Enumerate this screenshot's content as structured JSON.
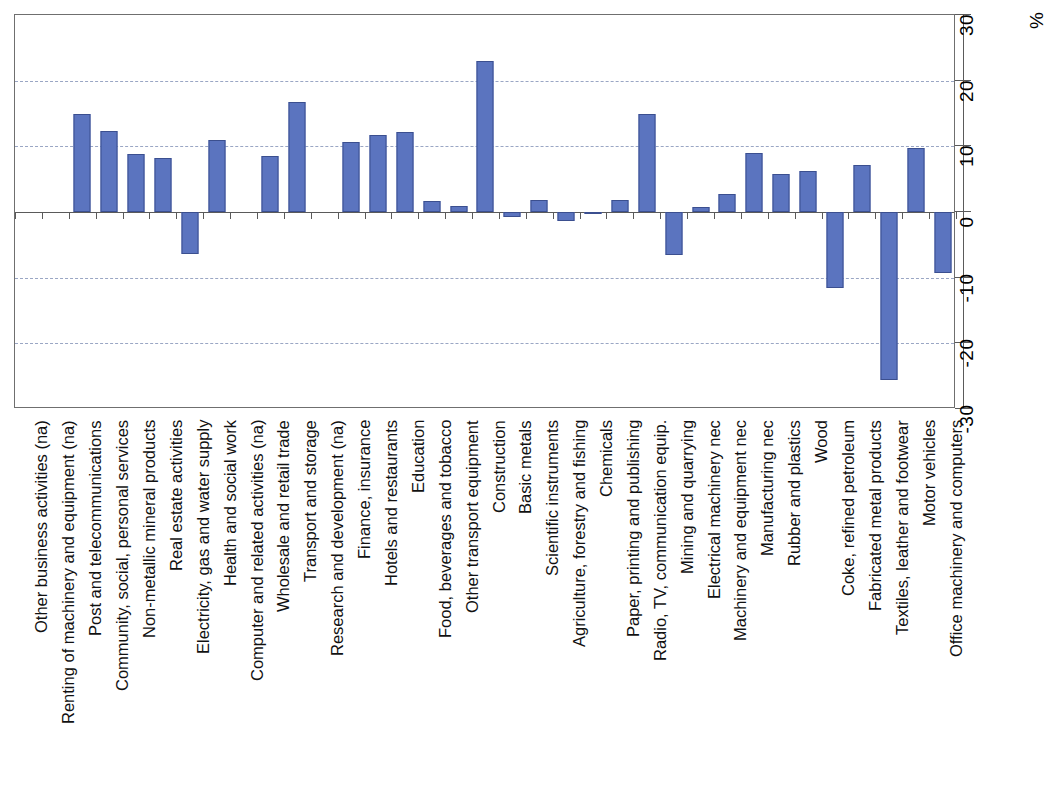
{
  "chart_data": {
    "type": "bar",
    "title": "",
    "subtitle": "",
    "xlabel": "",
    "ylabel": "%",
    "unit_label": "%",
    "ylim": [
      -30,
      30
    ],
    "ytick_values": [
      30,
      20,
      10,
      0,
      -10,
      -20,
      -30
    ],
    "ytick_labels": [
      "30",
      "20",
      "10",
      "0",
      "-10",
      "-20",
      "-30"
    ],
    "gridlines_at": [
      20,
      10,
      -10,
      -20
    ],
    "grid": true,
    "legend": false,
    "legend_position": "none",
    "axis_position": "right",
    "bar_color": "#5b74bf",
    "bar_border_color": "#3b4f8f",
    "gridline_color": "#9aa6c4",
    "axis_color": "#5a5a5a",
    "categories": [
      "Other business activities (na)",
      "Renting of machinery and equipment (na)",
      "Post and telecommunications",
      "Community, social, personal services",
      "Non-metallic mineral products",
      "Real estate activities",
      "Electricity, gas and water supply",
      "Health and social work",
      "Computer and related activities (na)",
      "Wholesale and retail trade",
      "Transport and storage",
      "Research and development (na)",
      "Finance, insurance",
      "Hotels and restaurants",
      "Education",
      "Food, beverages and tobacco",
      "Other transport equipment",
      "Construction",
      "Basic metals",
      "Scientific instruments",
      "Agriculture, forestry and fishing",
      "Chemicals",
      "Paper, printing and publishing",
      "Radio, TV, communication equip.",
      "Mining and quarrying",
      "Electrical machinery nec",
      "Machinery and equipment nec",
      "Manufacturing nec",
      "Rubber and plastics",
      "Wood",
      "Coke, refined petroleum",
      "Fabricated metal products",
      "Textiles, leather and footwear",
      "Motor vehicles",
      "Office machinery and computers"
    ],
    "values": [
      null,
      null,
      14.9,
      12.3,
      8.9,
      8.2,
      -6.4,
      11.0,
      null,
      8.6,
      16.7,
      null,
      10.6,
      11.7,
      12.2,
      1.7,
      0.9,
      23.0,
      -0.7,
      1.8,
      -1.3,
      -0.2,
      1.9,
      15.0,
      -6.5,
      0.8,
      2.7,
      9.0,
      5.8,
      6.3,
      -11.5,
      7.2,
      -25.6,
      9.7,
      -9.3
    ]
  }
}
